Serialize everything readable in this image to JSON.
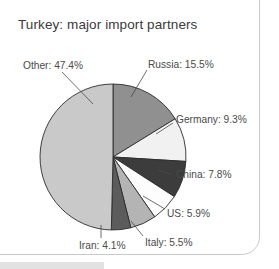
{
  "chart_data": {
    "type": "pie",
    "title": "Turkey: major import partners",
    "xlabel": "",
    "ylabel": "",
    "legend_position": "none",
    "grid": false,
    "start_angle_deg": 0,
    "direction": "clockwise",
    "categories": [
      "Russia",
      "Germany",
      "China",
      "US",
      "Italy",
      "Iran",
      "Other"
    ],
    "values": [
      15.5,
      9.3,
      7.8,
      5.9,
      5.5,
      4.1,
      47.4
    ],
    "unit": "%",
    "slices": [
      {
        "name": "Russia",
        "value": 15.5,
        "label": "Russia: 15.5%",
        "color": "#909090"
      },
      {
        "name": "Germany",
        "value": 9.3,
        "label": "Germany: 9.3%",
        "color": "#f1f1f1"
      },
      {
        "name": "China",
        "value": 7.8,
        "label": "China: 7.8%",
        "color": "#3c3c3c"
      },
      {
        "name": "US",
        "value": 5.9,
        "label": "US: 5.9%",
        "color": "#fdfdfd"
      },
      {
        "name": "Italy",
        "value": 5.5,
        "label": "Italy: 5.5%",
        "color": "#b4b4b4"
      },
      {
        "name": "Iran",
        "value": 4.1,
        "label": "Iran: 4.1%",
        "color": "#5c5c5c"
      },
      {
        "name": "Other",
        "value": 47.4,
        "label": "Other: 47.4%",
        "color": "#c9c9c9"
      }
    ]
  },
  "chart": {
    "title": "Turkey: major import partners",
    "labels": {
      "other": "Other: 47.4%",
      "russia": "Russia: 15.5%",
      "germany": "Germany: 9.3%",
      "china": "China: 7.8%",
      "us": "US: 5.9%",
      "italy": "Italy: 5.5%",
      "iran": "Iran: 4.1%"
    }
  },
  "colors": {
    "slice_russia": "#909090",
    "slice_germany": "#f1f1f1",
    "slice_china": "#3c3c3c",
    "slice_us": "#fdfdfd",
    "slice_italy": "#b4b4b4",
    "slice_iran": "#5c5c5c",
    "slice_other": "#c9c9c9",
    "outline": "#2b2b2b",
    "text": "#4a4a4a",
    "frame": "#c9c9c9"
  }
}
